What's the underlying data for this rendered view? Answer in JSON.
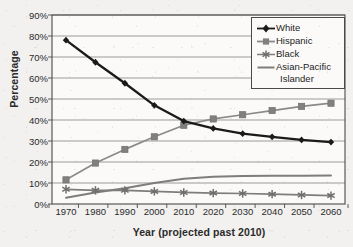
{
  "chart_data": {
    "type": "line",
    "title": "",
    "xlabel": "Year (projected past 2010)",
    "ylabel": "Percentage",
    "grid": true,
    "legend_position": "top-right",
    "x": [
      1970,
      1980,
      1990,
      2000,
      2010,
      2020,
      2030,
      2040,
      2050,
      2060
    ],
    "categories": [
      "1970",
      "1980",
      "1990",
      "2000",
      "2010",
      "2020",
      "2030",
      "2040",
      "2050",
      "2060"
    ],
    "xlim": [
      1965,
      2065
    ],
    "ylim": [
      0,
      90
    ],
    "ytick_labels": [
      "0%",
      "10%",
      "20%",
      "30%",
      "40%",
      "50%",
      "60%",
      "70%",
      "80%",
      "90%"
    ],
    "ytick_values": [
      0,
      10,
      20,
      30,
      40,
      50,
      60,
      70,
      80,
      90
    ],
    "series": [
      {
        "name": "White",
        "color": "#1a1a1a",
        "marker": "diamond",
        "values": [
          78,
          67.5,
          57.5,
          47,
          39.5,
          36,
          33.5,
          32,
          30.5,
          29.5
        ]
      },
      {
        "name": "Hispanic",
        "color": "#8a8a8a",
        "marker": "square",
        "values": [
          11.5,
          19.5,
          26,
          32,
          37.5,
          40.5,
          42.5,
          44.5,
          46.5,
          48
        ]
      },
      {
        "name": "Black",
        "color": "#7d7d7d",
        "marker": "asterisk",
        "values": [
          7,
          6.5,
          6.5,
          6,
          5.5,
          5.2,
          5,
          4.7,
          4.3,
          4
        ]
      },
      {
        "name": "Asian-Pacific Islander",
        "color": "#7d7d7d",
        "marker": "none",
        "values": [
          3,
          5.5,
          7.5,
          10,
          12,
          13,
          13.3,
          13.4,
          13.5,
          13.6
        ]
      }
    ]
  },
  "legend": {
    "entries": [
      {
        "label": "White",
        "marker": "diamond-marker",
        "color": "#1a1a1a"
      },
      {
        "label": "Hispanic",
        "marker": "square-marker",
        "color": "#8a8a8a"
      },
      {
        "label": "Black",
        "marker": "asterisk-marker",
        "color": "#7d7d7d"
      },
      {
        "label": "Asian-Pacific",
        "marker": "line-marker",
        "color": "#7d7d7d"
      }
    ],
    "wrapped_label_continuation": "Islander"
  },
  "axes": {
    "y_title": "Percentage",
    "x_title": "Year (projected past 2010)",
    "y_ticks": [
      "90%",
      "80%",
      "70%",
      "60%",
      "50%",
      "40%",
      "30%",
      "20%",
      "10%",
      "0%"
    ],
    "x_ticks": [
      "1970",
      "1980",
      "1990",
      "2000",
      "2010",
      "2020",
      "2030",
      "2040",
      "2050",
      "2060"
    ]
  },
  "colors": {
    "background": "#f2f1ef",
    "plot_background": "#fbfaf8",
    "grid": "#909090",
    "axis": "#3a3a3a",
    "white_series": "#1a1a1a",
    "gray_series": "#8a8a8a"
  }
}
